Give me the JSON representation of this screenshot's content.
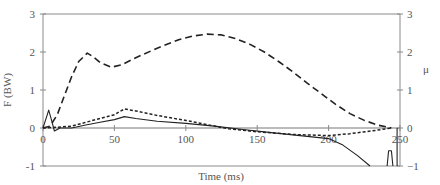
{
  "chart_data": {
    "type": "line",
    "title": "",
    "xlabel": "Time (ms)",
    "ylabel": "F (BW)",
    "y2label": "μ",
    "xlim": [
      0,
      250
    ],
    "ylim": [
      -1,
      3
    ],
    "y2lim": [
      -1,
      3
    ],
    "grid": false,
    "legend": "none",
    "x_ticks": [
      0,
      50,
      100,
      150,
      200,
      250
    ],
    "y_ticks": [
      -1,
      0,
      1,
      2,
      3
    ],
    "y2_ticks": [
      -1,
      0,
      1,
      2,
      3
    ],
    "series": [
      {
        "name": "vertical force (dashed)",
        "style": "dashed",
        "x": [
          0,
          5,
          10,
          15,
          20,
          25,
          31,
          35,
          40,
          48,
          55,
          65,
          80,
          95,
          105,
          115,
          125,
          135,
          145,
          155,
          165,
          175,
          185,
          195,
          205,
          215,
          225,
          235,
          244
        ],
        "y": [
          0,
          0.05,
          0.35,
          0.85,
          1.35,
          1.75,
          1.97,
          1.88,
          1.72,
          1.6,
          1.66,
          1.85,
          2.1,
          2.32,
          2.42,
          2.47,
          2.45,
          2.35,
          2.2,
          2.0,
          1.75,
          1.48,
          1.18,
          0.9,
          0.62,
          0.38,
          0.2,
          0.07,
          0
        ]
      },
      {
        "name": "horizontal force (dotted)",
        "style": "dotted",
        "x": [
          0,
          10,
          20,
          30,
          40,
          50,
          57,
          65,
          80,
          100,
          120,
          130,
          150,
          175,
          200,
          215,
          230,
          244
        ],
        "y": [
          0,
          0.02,
          0.05,
          0.15,
          0.25,
          0.35,
          0.5,
          0.45,
          0.33,
          0.2,
          0.05,
          -0.02,
          -0.1,
          -0.17,
          -0.2,
          -0.15,
          -0.08,
          0
        ]
      },
      {
        "name": "friction coefficient μ (solid)",
        "style": "solid",
        "x": [
          0,
          3,
          4,
          6,
          8,
          12,
          20,
          30,
          40,
          50,
          57,
          65,
          80,
          100,
          120,
          140,
          160,
          180,
          200,
          210,
          220,
          229
        ],
        "y": [
          0,
          0.35,
          0.47,
          0.2,
          -0.08,
          0.0,
          0.0,
          0.08,
          0.15,
          0.22,
          0.3,
          0.25,
          0.18,
          0.12,
          0.05,
          -0.04,
          -0.12,
          -0.2,
          -0.28,
          -0.45,
          -0.72,
          -1.0
        ]
      },
      {
        "name": "μ spike near end (solid)",
        "style": "solid",
        "x": [
          241,
          242,
          243,
          244,
          245
        ],
        "y": [
          -1,
          -0.6,
          -0.6,
          -0.6,
          -1
        ]
      },
      {
        "name": "μ vertical at end (solid)",
        "style": "solid",
        "x": [
          248,
          248
        ],
        "y": [
          -1,
          0
        ]
      }
    ]
  }
}
